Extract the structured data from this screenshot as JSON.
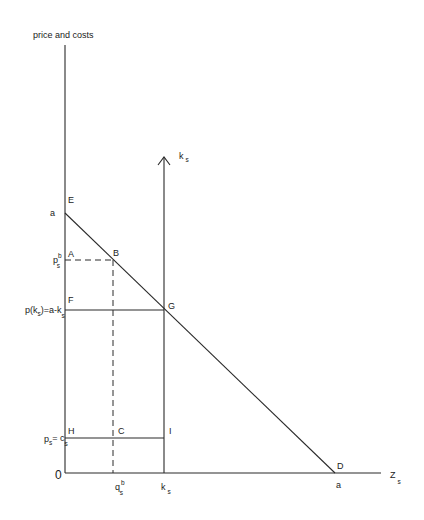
{
  "diagram": {
    "y_axis_label": "price and costs",
    "x_axis_label": {
      "main": "Z",
      "sub": "s"
    },
    "capacity_axis_label": {
      "main": "k",
      "sub": "s"
    },
    "origin_label": "0",
    "points": {
      "E": "E",
      "A": "A",
      "B": "B",
      "F": "F",
      "G": "G",
      "H": "H",
      "C": "C",
      "I": "I",
      "D": "D"
    },
    "y_tick_labels": {
      "a": "a",
      "p_b": {
        "main": "p",
        "sup": "b",
        "sub": "s"
      },
      "p_k": {
        "pre": "p(k",
        "sub1": "s",
        "mid": ")=a-k",
        "sub2": "s"
      },
      "p_c": {
        "main1": "p",
        "sub1": "s",
        "eq": "= c",
        "sub2": "s"
      }
    },
    "x_tick_labels": {
      "q_b": {
        "main": "q",
        "sup": "b",
        "sub": "s"
      },
      "k": {
        "main": "k",
        "sub": "s"
      },
      "a": "a"
    },
    "curves": [
      {
        "name": "demand",
        "from": "E",
        "to": "D",
        "style": "solid"
      },
      {
        "name": "capacity",
        "at": "k_s",
        "style": "solid",
        "arrow": true
      },
      {
        "name": "price-p-b",
        "from": "A",
        "to": "B",
        "style": "dashed"
      },
      {
        "name": "quantity-q-b",
        "from": "B",
        "to": "q_b",
        "style": "dashed"
      },
      {
        "name": "price-at-capacity",
        "from": "F",
        "to": "G",
        "style": "solid"
      },
      {
        "name": "cost-line",
        "from": "H",
        "to": "I",
        "style": "solid"
      }
    ]
  }
}
